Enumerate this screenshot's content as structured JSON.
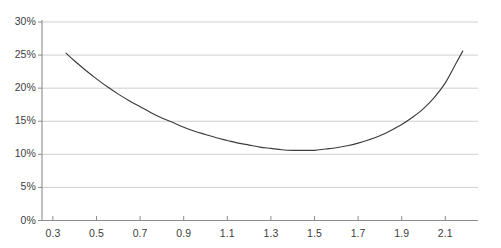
{
  "chart_data": {
    "type": "line",
    "title": "",
    "subtitle": "",
    "xlabel": "",
    "ylabel": "",
    "grid": true,
    "legend": false,
    "legend_position": "none",
    "xlim": [
      0.25,
      2.25
    ],
    "ylim": [
      0,
      30
    ],
    "xticks": [
      0.3,
      0.5,
      0.7,
      0.9,
      1.1,
      1.3,
      1.5,
      1.7,
      1.9,
      2.1
    ],
    "xtick_labels": [
      "0.3",
      "0.5",
      "0.7",
      "0.9",
      "1.1",
      "1.3",
      "1.5",
      "1.7",
      "1.9",
      "2.1"
    ],
    "yticks": [
      0,
      5,
      10,
      15,
      20,
      25,
      30
    ],
    "ytick_labels": [
      "0%",
      "5%",
      "10%",
      "15%",
      "20%",
      "25%",
      "30%"
    ],
    "series": [
      {
        "name": "curve",
        "color": "#3c3c3c",
        "x": [
          0.36,
          0.4,
          0.45,
          0.5,
          0.55,
          0.6,
          0.65,
          0.7,
          0.75,
          0.8,
          0.85,
          0.9,
          0.95,
          1.0,
          1.05,
          1.1,
          1.15,
          1.2,
          1.25,
          1.3,
          1.35,
          1.4,
          1.45,
          1.5,
          1.55,
          1.6,
          1.65,
          1.7,
          1.75,
          1.8,
          1.85,
          1.9,
          1.95,
          2.0,
          2.05,
          2.1,
          2.15,
          2.18
        ],
        "values": [
          25.3,
          24.1,
          22.7,
          21.4,
          20.2,
          19.1,
          18.1,
          17.2,
          16.3,
          15.5,
          14.8,
          14.1,
          13.5,
          13.0,
          12.5,
          12.1,
          11.7,
          11.4,
          11.1,
          10.9,
          10.7,
          10.6,
          10.6,
          10.6,
          10.8,
          11.0,
          11.3,
          11.7,
          12.2,
          12.8,
          13.6,
          14.5,
          15.6,
          16.9,
          18.6,
          20.8,
          23.8,
          25.6
        ]
      }
    ],
    "annotations": []
  }
}
